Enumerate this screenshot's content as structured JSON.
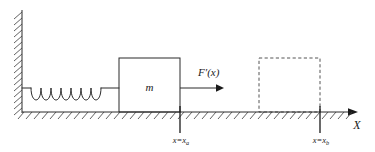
{
  "figure": {
    "type": "physics-diagram",
    "background_color": "#ffffff",
    "line_color": "#2b2b2b",
    "dashed_color": "#555555"
  },
  "labels": {
    "mass": "m",
    "force": "F′(x)",
    "force_italic_base": "F",
    "force_prime": "′",
    "force_arg": "(x)",
    "axis": "X",
    "tick_a_prefix": "x=x",
    "tick_a_sub": "a",
    "tick_b_prefix": "x=x",
    "tick_b_sub": "b"
  },
  "elements": {
    "wall": {
      "name": "fixed-wall",
      "x": 22,
      "y_top": 10,
      "y_bottom": 112,
      "hatch_side": "left",
      "hatch_count": 16
    },
    "ground": {
      "name": "ground-surface",
      "y": 112,
      "x_start": 22,
      "x_end": 352,
      "hatch_count": 42
    },
    "spring": {
      "name": "spring",
      "x_start": 23,
      "x_end": 119,
      "y_center": 88,
      "coils": 6,
      "coil_height": 17
    },
    "block_solid": {
      "name": "mass-block",
      "x": 119,
      "y": 58,
      "width": 61,
      "height": 54,
      "style": "solid"
    },
    "block_dashed": {
      "name": "mass-block-final-position",
      "x": 259,
      "y": 58,
      "width": 61,
      "height": 54,
      "style": "dashed"
    },
    "force_arrow": {
      "name": "force-arrow",
      "x_start": 180,
      "x_end": 222,
      "y": 88
    },
    "axis_arrow": {
      "name": "x-axis",
      "x_start": 22,
      "x_end": 358,
      "y": 112
    },
    "tick_a": {
      "name": "position-marker-xa",
      "x": 180,
      "y_top": 108,
      "y_bottom": 133
    },
    "tick_b": {
      "name": "position-marker-xb",
      "x": 320,
      "y_top": 108,
      "y_bottom": 133
    }
  }
}
